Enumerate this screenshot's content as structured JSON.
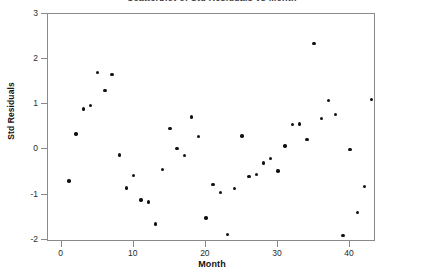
{
  "chart_data": {
    "type": "scatter",
    "title": "Scatterplot of Std Residuals vs Month",
    "title_truncated": true,
    "xlabel": "Month",
    "ylabel": "Std Residuals",
    "xlim": [
      -1.9,
      43.6
    ],
    "ylim": [
      -2.05,
      3.0
    ],
    "xticks": [
      0,
      10,
      20,
      30,
      40
    ],
    "yticks": [
      -2,
      -1,
      0,
      1,
      2,
      3
    ],
    "xtick_labels": [
      "0",
      "10",
      "20",
      "30",
      "40"
    ],
    "ytick_labels": [
      "-2",
      "-1",
      "0",
      "1",
      "2",
      "3"
    ],
    "grid": false,
    "legend": false,
    "marker": "filled-circle",
    "marker_color": "#111111",
    "series": [
      {
        "name": "Std Residuals",
        "points": [
          {
            "x": 1,
            "y": -0.7
          },
          {
            "x": 2,
            "y": 0.34
          },
          {
            "x": 3,
            "y": 0.9
          },
          {
            "x": 4,
            "y": 0.97
          },
          {
            "x": 5,
            "y": 1.7
          },
          {
            "x": 6,
            "y": 1.3
          },
          {
            "x": 7,
            "y": 1.66
          },
          {
            "x": 8,
            "y": -0.12
          },
          {
            "x": 9,
            "y": -0.85
          },
          {
            "x": 10,
            "y": -0.58
          },
          {
            "x": 11,
            "y": -1.12
          },
          {
            "x": 12,
            "y": -1.16
          },
          {
            "x": 13,
            "y": -1.65
          },
          {
            "x": 14,
            "y": -0.45
          },
          {
            "x": 15,
            "y": 0.46
          },
          {
            "x": 16,
            "y": 0.02
          },
          {
            "x": 17,
            "y": -0.13
          },
          {
            "x": 18,
            "y": 0.72
          },
          {
            "x": 19,
            "y": 0.29
          },
          {
            "x": 20,
            "y": -1.52
          },
          {
            "x": 21,
            "y": -0.78
          },
          {
            "x": 22,
            "y": -0.95
          },
          {
            "x": 23,
            "y": -1.88
          },
          {
            "x": 24,
            "y": -0.86
          },
          {
            "x": 25,
            "y": 0.3
          },
          {
            "x": 26,
            "y": -0.6
          },
          {
            "x": 27,
            "y": -0.55
          },
          {
            "x": 28,
            "y": -0.3
          },
          {
            "x": 29,
            "y": -0.2
          },
          {
            "x": 30,
            "y": -0.48
          },
          {
            "x": 31,
            "y": 0.08
          },
          {
            "x": 32,
            "y": 0.55
          },
          {
            "x": 33,
            "y": 0.56
          },
          {
            "x": 34,
            "y": 0.22
          },
          {
            "x": 35,
            "y": 2.35
          },
          {
            "x": 36,
            "y": 0.68
          },
          {
            "x": 37,
            "y": 1.08
          },
          {
            "x": 38,
            "y": 0.78
          },
          {
            "x": 39,
            "y": -1.9
          },
          {
            "x": 40,
            "y": 0.0
          },
          {
            "x": 41,
            "y": -1.4
          },
          {
            "x": 42,
            "y": -0.82
          },
          {
            "x": 43,
            "y": 1.1
          }
        ]
      }
    ]
  }
}
